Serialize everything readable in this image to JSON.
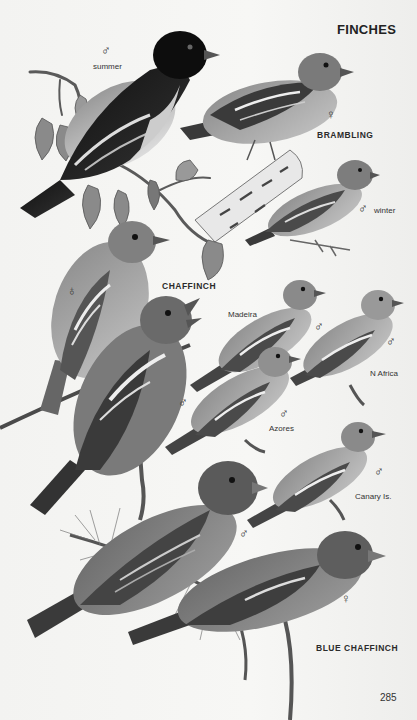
{
  "page": {
    "section_title": "FINCHES",
    "page_number": "285"
  },
  "species": [
    {
      "name": "BRAMBLING",
      "figures": [
        {
          "sex": "♂",
          "sex_label": "male",
          "note": "summer"
        },
        {
          "sex": "♀",
          "sex_label": "female",
          "note": ""
        },
        {
          "sex": "♂",
          "sex_label": "male",
          "note": "winter"
        }
      ]
    },
    {
      "name": "CHAFFINCH",
      "figures": [
        {
          "sex": "♀",
          "sex_label": "female",
          "note": ""
        },
        {
          "sex": "♂",
          "sex_label": "male",
          "note": ""
        },
        {
          "sex": "♂",
          "sex_label": "male",
          "note": "Madeira"
        },
        {
          "sex": "♂",
          "sex_label": "male",
          "note": "N Africa"
        },
        {
          "sex": "♂",
          "sex_label": "male",
          "note": "Azores"
        },
        {
          "sex": "♂",
          "sex_label": "male",
          "note": "Canary Is."
        }
      ]
    },
    {
      "name": "BLUE CHAFFINCH",
      "figures": [
        {
          "sex": "♂",
          "sex_label": "male",
          "note": ""
        },
        {
          "sex": "♀",
          "sex_label": "female",
          "note": ""
        }
      ]
    }
  ],
  "colors": {
    "paper": "#f4f4f2",
    "text": "#2a2a2a"
  }
}
